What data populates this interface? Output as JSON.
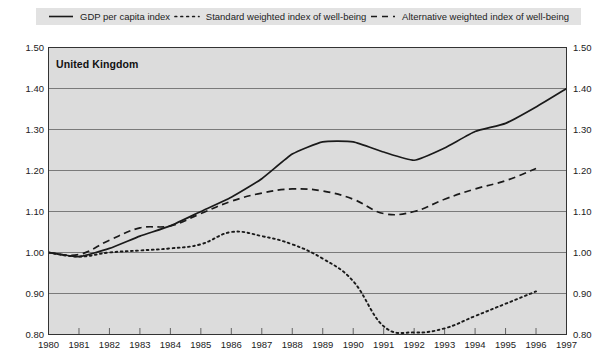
{
  "legend": {
    "items": [
      {
        "label": "GDP per capita index",
        "style": "solid",
        "color": "#1a1a1a",
        "key": "gdp"
      },
      {
        "label": "Standard weighted index of well-being",
        "style": "dotted",
        "color": "#1a1a1a",
        "key": "standard"
      },
      {
        "label": "Alternative weighted index of well-being",
        "style": "dashed",
        "color": "#1a1a1a",
        "key": "alternative"
      }
    ]
  },
  "panel": {
    "title": "United Kingdom"
  },
  "axes": {
    "y_tick_labels": [
      "1.50",
      "1.40",
      "1.30",
      "1.20",
      "1.10",
      "1.00",
      "0.90",
      "0.80"
    ],
    "x_tick_labels": [
      "1980",
      "1981",
      "1982",
      "1983",
      "1984",
      "1985",
      "1986",
      "1987",
      "1988",
      "1989",
      "1990",
      "1991",
      "1992",
      "1993",
      "1994",
      "1995",
      "1996",
      "1997"
    ]
  },
  "colors": {
    "plot_background": "#dcdcdc",
    "legend_background": "#e2e2e2",
    "gridline": "#6e6e6e",
    "frame": "#333333",
    "series": "#1a1a1a"
  },
  "chart_data": {
    "type": "line",
    "title": "United Kingdom",
    "xlabel": "",
    "ylabel": "",
    "xlim": [
      1980,
      1997
    ],
    "ylim": [
      0.8,
      1.5
    ],
    "ytick_step": 0.1,
    "grid": true,
    "legend_position": "top",
    "x": [
      1980,
      1981,
      1982,
      1983,
      1984,
      1985,
      1986,
      1987,
      1988,
      1989,
      1990,
      1991,
      1992,
      1993,
      1994,
      1995,
      1996,
      1997
    ],
    "series": [
      {
        "name": "GDP per capita index",
        "style": "solid",
        "values": [
          1.0,
          0.99,
          1.01,
          1.04,
          1.065,
          1.1,
          1.135,
          1.18,
          1.24,
          1.27,
          1.27,
          1.245,
          1.225,
          1.255,
          1.295,
          1.315,
          1.355,
          1.4
        ]
      },
      {
        "name": "Standard weighted index of well-being",
        "style": "dotted",
        "values": [
          1.0,
          0.99,
          1.0,
          1.005,
          1.01,
          1.02,
          1.05,
          1.04,
          1.02,
          0.985,
          0.93,
          0.82,
          0.805,
          0.815,
          0.845,
          0.875,
          0.905,
          null
        ]
      },
      {
        "name": "Alternative weighted index of well-being",
        "style": "dashed",
        "values": [
          1.0,
          0.995,
          1.03,
          1.06,
          1.065,
          1.095,
          1.125,
          1.145,
          1.155,
          1.15,
          1.13,
          1.095,
          1.1,
          1.13,
          1.155,
          1.175,
          1.205,
          null
        ]
      }
    ]
  }
}
